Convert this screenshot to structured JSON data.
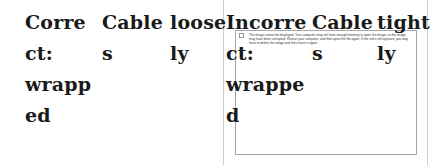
{
  "table": {
    "columns": [
      {
        "label": "Correct: wrapped",
        "lines": [
          "Corre",
          "ct:",
          "wrapp",
          "ed"
        ]
      },
      {
        "label": "Cables",
        "lines": [
          "Cable",
          "s"
        ]
      },
      {
        "label": "loosely",
        "lines": [
          "loose",
          "ly"
        ]
      },
      {
        "label": "Incorrect: wrapped",
        "lines": [
          "Incorre",
          "ct:",
          "wrappe",
          "d"
        ]
      },
      {
        "label": "Cables",
        "lines": [
          "Cable",
          "s"
        ]
      },
      {
        "label": "tightly",
        "lines": [
          "tight",
          "ly"
        ]
      }
    ]
  },
  "broken_image": {
    "message": "The image cannot be displayed. Your computer may not have enough memory to open the image, or the image may have been corrupted. Restart your computer, and then open the file again. If the red x still appears, you may have to delete the image and then insert it again."
  }
}
